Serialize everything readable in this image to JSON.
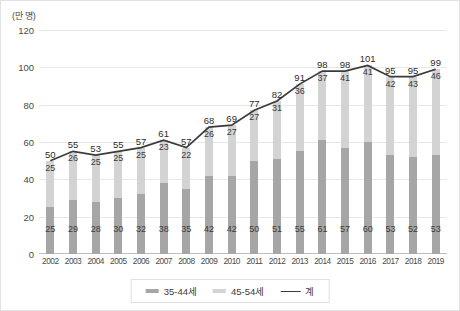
{
  "chart_data": {
    "type": "bar",
    "title": "",
    "subtitle": "",
    "unit_label": "(만 명)",
    "xlabel": "",
    "ylabel": "",
    "ylim": [
      0,
      120
    ],
    "yticks": [
      0,
      20,
      40,
      60,
      80,
      100,
      120
    ],
    "grid": true,
    "stacked": true,
    "legend_position": "bottom",
    "categories": [
      "2002",
      "2003",
      "2004",
      "2005",
      "2006",
      "2007",
      "2008",
      "2009",
      "2010",
      "2011",
      "2012",
      "2013",
      "2014",
      "2015",
      "2016",
      "2017",
      "2018",
      "2019"
    ],
    "series": [
      {
        "name": "35-44세",
        "kind": "bar-segment-lower",
        "color": "#a6a6a6",
        "values": [
          25,
          29,
          28,
          30,
          32,
          38,
          35,
          42,
          42,
          50,
          51,
          55,
          61,
          57,
          60,
          53,
          52,
          53
        ]
      },
      {
        "name": "45-54세",
        "kind": "bar-segment-upper",
        "color": "#d3d3d3",
        "values": [
          25,
          26,
          25,
          25,
          25,
          23,
          22,
          26,
          27,
          27,
          31,
          36,
          37,
          41,
          41,
          42,
          43,
          46
        ]
      },
      {
        "name": "계",
        "kind": "line",
        "color": "#3a3a3a",
        "values": [
          50,
          55,
          53,
          55,
          57,
          61,
          57,
          68,
          69,
          77,
          82,
          91,
          98,
          98,
          101,
          95,
          95,
          99
        ]
      }
    ]
  },
  "legend": {
    "items": [
      {
        "label": "35-44세",
        "marker": "bar",
        "color": "#a6a6a6"
      },
      {
        "label": "45-54세",
        "marker": "bar",
        "color": "#d3d3d3"
      },
      {
        "label": "계",
        "marker": "line",
        "color": "#3a3a3a"
      }
    ]
  }
}
